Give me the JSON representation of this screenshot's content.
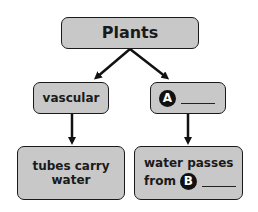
{
  "diagram": {
    "type": "concept-map",
    "root": {
      "label": "Plants"
    },
    "branches": [
      {
        "label": "vascular",
        "child": {
          "lines": [
            "tubes carry",
            "water"
          ]
        }
      },
      {
        "marker": "A",
        "blank": true,
        "child": {
          "line1": "water passes",
          "line2_label": "from",
          "marker": "B",
          "blank": true
        }
      }
    ],
    "colors": {
      "box_fill": "#c8c8c8",
      "border": "#1a1a1a",
      "marker_fill": "#111111",
      "arrow": "#111111"
    }
  }
}
